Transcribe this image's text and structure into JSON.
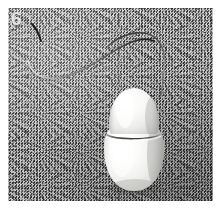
{
  "figure": {
    "number_label": "6",
    "caption": "",
    "scene": "white oval optical mouse with thin cable on a gray stucco textured surface"
  },
  "photo": {
    "background_color": "#8a8a8a",
    "background_texture": "stucco-noise",
    "plate_color": "#ffffff",
    "alt_text": "White egg-shaped computer mouse photographed on gray textured wall"
  },
  "mouse": {
    "body_color": "#f2f2f0",
    "shadow_color": "#9b9b99",
    "seam_color": "#5a5a58",
    "highlight_color": "#ffffff",
    "parts": {
      "button_label": "mouse-top-button",
      "body_label": "mouse-body",
      "seam_label": "mouse-seam-line"
    }
  },
  "cable": {
    "color_dark": "#2b2b2b",
    "color_light": "#e8e8e8",
    "description": "thin S-curved cable looping from upper-left across to mouse top"
  },
  "icons": {
    "mouse_icon": "mouse-icon",
    "cable_icon": "cable-icon"
  }
}
